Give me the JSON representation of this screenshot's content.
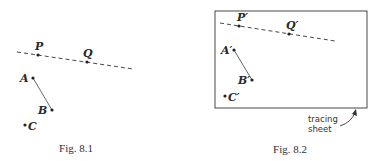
{
  "figures": [
    {
      "id": "fig-8-1",
      "caption": "Fig. 8.1",
      "points": {
        "P": {
          "label": "P"
        },
        "Q": {
          "label": "Q"
        },
        "A": {
          "label": "A"
        },
        "B": {
          "label": "B"
        },
        "C": {
          "label": "C"
        }
      }
    },
    {
      "id": "fig-8-2",
      "caption": "Fig. 8.2",
      "points": {
        "P": {
          "label": "P′"
        },
        "Q": {
          "label": "Q′"
        },
        "A": {
          "label": "A′"
        },
        "B": {
          "label": "B′"
        },
        "C": {
          "label": "C′"
        }
      },
      "annotation": {
        "line1": "tracing",
        "line2": "sheet"
      }
    }
  ],
  "colors": {
    "ink": "#2a2a2a",
    "background": "#ffffff"
  }
}
